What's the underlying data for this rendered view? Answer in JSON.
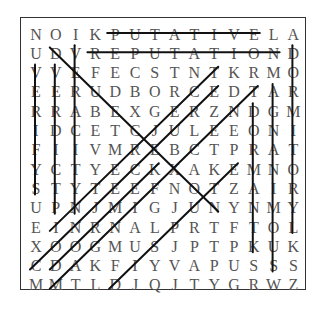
{
  "puzzle": {
    "rows": [
      "NOIKPUTATIVELA",
      "UDVREPUTATIOND",
      "VVEFECSTNTKRMO",
      "EERUDBORCEDTAR",
      "RRABEXGERZNDGM",
      "IDCETCJULEEONI",
      "FIIVMREBCTPRAT",
      "YCTYECKXAKEMNO",
      "STYTEEFNOTZAIR",
      "UPNJMIGJUNYNMY",
      "EINRNALPRTFTOL",
      "XOOGMUSJPTPKUK",
      "CDAKFIYVAPUSSS",
      "MMTLDJQJTYGRWZ"
    ],
    "found_lines": [
      {
        "from": [
          0,
          4
        ],
        "to": [
          0,
          11
        ]
      },
      {
        "from": [
          1,
          3
        ],
        "to": [
          1,
          12
        ]
      },
      {
        "from": [
          1,
          1
        ],
        "to": [
          9,
          9
        ]
      },
      {
        "from": [
          2,
          0
        ],
        "to": [
          8,
          0
        ]
      },
      {
        "from": [
          2,
          1
        ],
        "to": [
          9,
          1
        ]
      },
      {
        "from": [
          1,
          2
        ],
        "to": [
          9,
          2
        ]
      },
      {
        "from": [
          4,
          11
        ],
        "to": [
          11,
          11
        ]
      },
      {
        "from": [
          3,
          12
        ],
        "to": [
          12,
          12
        ]
      },
      {
        "from": [
          1,
          13
        ],
        "to": [
          10,
          13
        ]
      },
      {
        "from": [
          2,
          9
        ],
        "to": [
          10,
          1
        ]
      },
      {
        "from": [
          3,
          9
        ],
        "to": [
          12,
          0
        ]
      },
      {
        "from": [
          3,
          11
        ],
        "to": [
          13,
          1
        ]
      },
      {
        "from": [
          7,
          6
        ],
        "to": [
          12,
          1
        ]
      },
      {
        "from": [
          7,
          10
        ],
        "to": [
          13,
          4
        ]
      }
    ],
    "line_color": "#111111",
    "letter_color": "#555555"
  }
}
